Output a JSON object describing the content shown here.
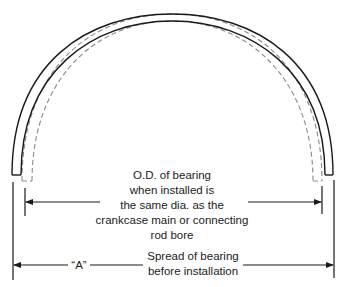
{
  "diagram": {
    "colors": {
      "solid_line": "#1a1a1a",
      "dashed_line": "#8a8a8a",
      "text": "#222222",
      "background": "#ffffff"
    },
    "installed_label": {
      "lines": [
        "O.D. of bearing",
        "when installed is",
        "the same dia. as the",
        "crankcase main or connecting",
        "rod bore"
      ]
    },
    "spread_label": {
      "marker": "“A”",
      "lines": [
        "Spread of bearing",
        "before installation"
      ]
    },
    "legend_hint": {
      "solid": "bearing before installation (spread)",
      "dashed": "bearing when installed"
    }
  }
}
